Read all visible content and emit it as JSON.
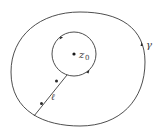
{
  "diagram": {
    "type": "complex-analysis-contour",
    "labels": {
      "outer_contour": "γ",
      "point": "z",
      "point_subscript": "0",
      "cut_line": "ℓ"
    },
    "colors": {
      "stroke": "#3a3a3a",
      "background": "#ffffff"
    },
    "elements": [
      {
        "name": "outer-contour",
        "label": "γ",
        "shape": "closed-oval",
        "orientation_marker": "arrow"
      },
      {
        "name": "inner-circle",
        "center_label": "z0",
        "shape": "circle",
        "orientation_markers": 2
      },
      {
        "name": "cut-line",
        "label": "ℓ",
        "connects": [
          "outer-contour",
          "inner-circle"
        ],
        "orientation_markers": 2
      },
      {
        "name": "center-point",
        "label": "z0"
      }
    ]
  }
}
